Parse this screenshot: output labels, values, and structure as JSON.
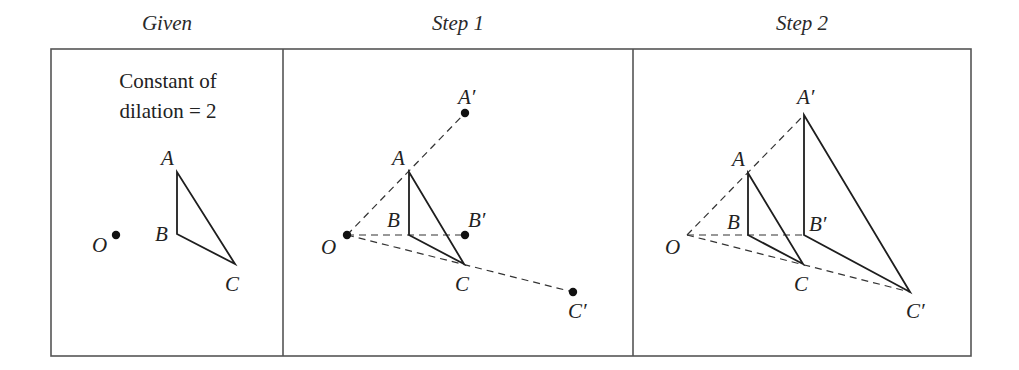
{
  "panels": [
    {
      "title": "Given",
      "note_line1": "Constant of",
      "note_line2": "dilation = 2",
      "labels": {
        "O": "O",
        "A": "A",
        "B": "B",
        "C": "C"
      }
    },
    {
      "title": "Step 1",
      "labels": {
        "O": "O",
        "A": "A",
        "B": "B",
        "C": "C",
        "A_prime": "A′",
        "B_prime": "B′",
        "C_prime": "C′"
      }
    },
    {
      "title": "Step 2",
      "labels": {
        "O": "O",
        "A": "A",
        "B": "B",
        "C": "C",
        "A_prime": "A′",
        "B_prime": "B′",
        "C_prime": "C′"
      }
    }
  ],
  "scale_factor": 2,
  "colors": {
    "line": "#1e1e1e",
    "frame": "#555555",
    "background": "#ffffff"
  }
}
